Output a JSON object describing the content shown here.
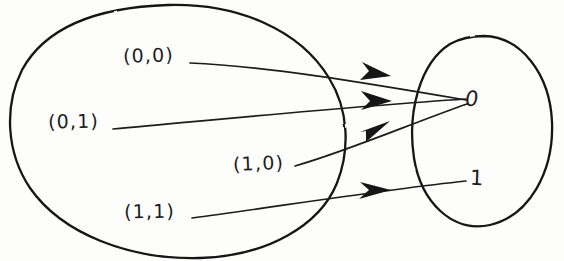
{
  "figure": {
    "kind": "mapping-diagram",
    "ink_color": "#1d1d1f",
    "background_color": "#fdfdfc"
  },
  "domain_set": {
    "name": "domain-oval",
    "elements": [
      {
        "id": "p00",
        "label": "(0,0)"
      },
      {
        "id": "p01",
        "label": "(0,1)"
      },
      {
        "id": "p10",
        "label": "(1,0)"
      },
      {
        "id": "p11",
        "label": "(1,1)"
      }
    ]
  },
  "codomain_set": {
    "name": "codomain-oval",
    "elements": [
      {
        "id": "v0",
        "label": "0"
      },
      {
        "id": "v1",
        "label": "1"
      }
    ]
  },
  "mappings": [
    {
      "from": "(0,0)",
      "to": "0"
    },
    {
      "from": "(0,1)",
      "to": "0"
    },
    {
      "from": "(1,0)",
      "to": "0"
    },
    {
      "from": "(1,1)",
      "to": "1"
    }
  ]
}
